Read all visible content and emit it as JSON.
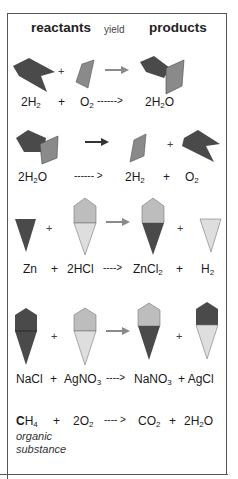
{
  "header": {
    "reactants": "reactants",
    "yield": "yield",
    "products": "products"
  },
  "colors": {
    "dark": "#4a4a4a",
    "medium": "#8a8a8a",
    "light": "#bdbdbd",
    "pale": "#dedede",
    "arrow": "#8a8a8a",
    "arrow_dark": "#333333",
    "frame": "#555555"
  },
  "reactions": [
    {
      "id": "synthesis-water",
      "plus_sign": "+",
      "terms": [
        {
          "coef": "2",
          "sym": "H",
          "sub": "2"
        },
        {
          "sep": "+"
        },
        {
          "coef": "",
          "sym": "O",
          "sub": "2"
        },
        {
          "arrow": "------>"
        },
        {
          "coef": "2",
          "sym": "H",
          "sub": "2",
          "tail": "O"
        }
      ]
    },
    {
      "id": "decomposition-water",
      "plus_sign": "+",
      "terms": [
        {
          "coef": "2",
          "sym": "H",
          "sub": "2",
          "tail": "O"
        },
        {
          "arrow": "------ >"
        },
        {
          "coef": "2",
          "sym": "H",
          "sub": "2"
        },
        {
          "sep": "+"
        },
        {
          "coef": "",
          "sym": "O",
          "sub": "2"
        }
      ]
    },
    {
      "id": "single-replacement",
      "plus_sign": "+",
      "terms": [
        {
          "coef": "",
          "sym": "Zn",
          "sub": ""
        },
        {
          "sep": "+"
        },
        {
          "coef": "2",
          "sym": "HCl",
          "sub": ""
        },
        {
          "arrow": "---->"
        },
        {
          "coef": "",
          "sym": "ZnCl",
          "sub": "2"
        },
        {
          "sep": "+"
        },
        {
          "coef": "",
          "sym": "H",
          "sub": "2"
        }
      ]
    },
    {
      "id": "double-replacement",
      "plus_sign": "+",
      "terms": [
        {
          "coef": "",
          "sym": "NaCl",
          "sub": ""
        },
        {
          "sep": "+"
        },
        {
          "coef": "",
          "sym": "AgNO",
          "sub": "3"
        },
        {
          "arrow": "---->"
        },
        {
          "coef": "",
          "sym": "NaNO",
          "sub": "3"
        },
        {
          "sep": "+"
        },
        {
          "coef": "",
          "sym": "AgCl",
          "sub": ""
        }
      ]
    },
    {
      "id": "combustion",
      "terms": [
        {
          "coef": "",
          "sym": "C",
          "bold": true,
          "sym2": "H",
          "sub": "4"
        },
        {
          "sep": "+"
        },
        {
          "coef": "2",
          "sym": "O",
          "sub": "2"
        },
        {
          "arrow": "---- >"
        },
        {
          "coef": "",
          "sym": "CO",
          "sub": "2"
        },
        {
          "sep": "+"
        },
        {
          "coef": "2",
          "sym": "H",
          "sub": "2",
          "tail": "O"
        }
      ],
      "note_line1": "organic",
      "note_line2": "substance"
    }
  ],
  "labels": {
    "r1": {
      "a_coef": "2H",
      "a_sub": "2",
      "plus": "+",
      "b": "O",
      "b_sub": "2",
      "arrow": "------>",
      "c": "2H",
      "c_sub": "2",
      "c_tail": "O"
    },
    "r2": {
      "a": "2H",
      "a_sub": "2",
      "a_tail": "O",
      "arrow": "------ >",
      "b": "2H",
      "b_sub": "2",
      "plus": "+",
      "c": "O",
      "c_sub": "2"
    },
    "r3": {
      "a": "Zn",
      "plus1": "+",
      "b": "2HCl",
      "arrow": "---->",
      "c": "ZnCl",
      "c_sub": "2",
      "plus2": "+",
      "d": "H",
      "d_sub": "2"
    },
    "r4": {
      "a": "NaCl",
      "plus1": "+",
      "b": "AgNO",
      "b_sub": "3",
      "arrow": "---->",
      "c": "NaNO",
      "c_sub": "3",
      "plus2": "+ AgCl"
    },
    "r5": {
      "a_bold": "C",
      "a": "H",
      "a_sub": "4",
      "plus1": "+",
      "b": "2O",
      "b_sub": "2",
      "arrow": "---- >",
      "c": "CO",
      "c_sub": "2",
      "plus2": "+",
      "d": "2H",
      "d_sub": "2",
      "d_tail": "O",
      "note1": "organic",
      "note2": "substance"
    }
  }
}
